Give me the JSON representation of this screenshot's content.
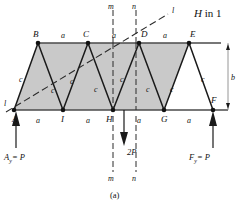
{
  "figure": {
    "caption": "(a)",
    "heading": "H in 1",
    "heading_italic_part": "H",
    "heading_rest": " in 1"
  },
  "truss": {
    "top_nodes": [
      {
        "id": "B",
        "label": "B",
        "x": 38,
        "y": 43
      },
      {
        "id": "C",
        "label": "C",
        "x": 88,
        "y": 43
      },
      {
        "id": "D",
        "label": "D",
        "x": 139,
        "y": 43
      },
      {
        "id": "E",
        "label": "E",
        "x": 189,
        "y": 43
      }
    ],
    "bottom_nodes": [
      {
        "id": "A",
        "label": "A",
        "x": 14,
        "y": 110
      },
      {
        "id": "I",
        "label": "I",
        "x": 63,
        "y": 110
      },
      {
        "id": "H",
        "label": "H",
        "x": 113,
        "y": 110
      },
      {
        "id": "G",
        "label": "G",
        "x": 164,
        "y": 110
      },
      {
        "id": "F",
        "label": "F",
        "x": 213,
        "y": 110
      }
    ],
    "top_dim_labels": [
      "a",
      "a",
      "a"
    ],
    "bottom_dim_labels": [
      "a",
      "a",
      "a",
      "a"
    ],
    "diagonal_labels": [
      "c",
      "c",
      "c",
      "c",
      "c",
      "c",
      "c",
      "c"
    ],
    "height_label": "b"
  },
  "sections": {
    "diagonal_cut_label": "l",
    "vertical_cut_top_left": "m",
    "vertical_cut_top_right": "n",
    "vertical_cut_bottom_left": "m",
    "vertical_cut_bottom_right": "n"
  },
  "loads": {
    "applied_load_label": "2P",
    "left_reaction_symbol": "A",
    "left_reaction_sub": "y",
    "left_reaction_value": "= P",
    "right_reaction_symbol": "F",
    "right_reaction_sub": "y",
    "right_reaction_value": "= P"
  },
  "colors": {
    "truss_fill": "#c9c9c9",
    "member_stroke": "#1a1a1a",
    "chord_stroke": "#4a4a4a",
    "section_line": "#2b2b2b",
    "dimension_line": "#8a8a8a",
    "text": "#111111",
    "background": "#ffffff"
  }
}
